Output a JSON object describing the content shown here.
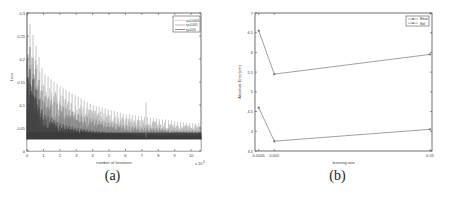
{
  "chart_data": [
    {
      "type": "line",
      "panel": "(a)",
      "title": "",
      "xlabel": "number of iterations",
      "x_multiplier": "x 10^4",
      "ylabel": "Loss",
      "xlim": [
        0,
        10.6
      ],
      "ylim": [
        0,
        0.3
      ],
      "xticks": [
        "0",
        "1",
        "2",
        "3",
        "4",
        "5",
        "6",
        "7",
        "8",
        "9",
        "10"
      ],
      "yticks": [
        "0",
        "0.05",
        "0.1",
        "0.15",
        "0.2",
        "0.25",
        "0.3"
      ],
      "legend": [
        "η=0.0005",
        "η=0.005",
        "η=0.05"
      ],
      "legend_position": "upper right",
      "grid": false,
      "series": [
        {
          "name": "η=0.0005",
          "x": [
            0,
            1,
            2,
            3,
            4,
            5,
            6,
            7,
            8,
            9,
            10,
            10.6
          ],
          "values": [
            0.3,
            0.17,
            0.14,
            0.12,
            0.1,
            0.09,
            0.08,
            0.075,
            0.07,
            0.065,
            0.06,
            0.06
          ]
        },
        {
          "name": "η=0.005",
          "x": [
            0,
            1,
            2,
            3,
            4,
            5,
            6,
            7,
            8,
            9,
            10,
            10.6
          ],
          "values": [
            0.25,
            0.12,
            0.1,
            0.08,
            0.07,
            0.06,
            0.055,
            0.05,
            0.05,
            0.045,
            0.045,
            0.045
          ]
        },
        {
          "name": "η=0.05",
          "x": [
            0,
            1,
            2,
            3,
            4,
            5,
            6,
            7,
            8,
            9,
            10,
            10.6
          ],
          "values": [
            0.2,
            0.08,
            0.06,
            0.05,
            0.045,
            0.04,
            0.04,
            0.035,
            0.035,
            0.035,
            0.035,
            0.035
          ]
        }
      ],
      "floor_value": 0.03
    },
    {
      "type": "line",
      "panel": "(b)",
      "title": "",
      "xlabel": "learning rate",
      "ylabel": "Absolute Error(cm)",
      "categories": [
        "0.0005",
        "0.005",
        "0.05"
      ],
      "x_positions": [
        0.0005,
        0.005,
        0.05
      ],
      "yticks": [
        "7",
        "6.5",
        "6",
        "5.5",
        "5",
        "4.5",
        "4",
        "3.5"
      ],
      "legend": [
        "Mean",
        "Std"
      ],
      "legend_position": "upper right",
      "grid": false,
      "series": [
        {
          "name": "Mean",
          "values": [
            6.55,
            5.45,
            5.95
          ]
        },
        {
          "name": "Std",
          "values": [
            4.6,
            3.75,
            4.05
          ]
        }
      ]
    }
  ],
  "captions": {
    "a": "(a)",
    "b": "(b)"
  },
  "labels": {
    "a_xlabel": "number of iterations",
    "a_ylabel": "Loss",
    "a_mult": "x 10",
    "a_mult_exp": "4",
    "a_legend_1": "η=0.0005",
    "a_legend_2": "η=0.005",
    "a_legend_3": "η=0.05",
    "b_xlabel": "learning rate",
    "b_ylabel": "Absolute Error(cm)",
    "b_legend_1": "Mean",
    "b_legend_2": "Std"
  }
}
